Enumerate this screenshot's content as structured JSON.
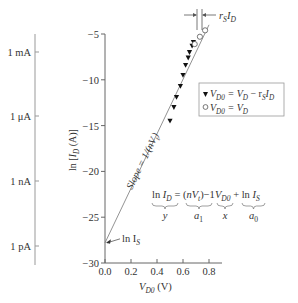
{
  "chart_data": {
    "type": "scatter",
    "title": "",
    "xlabel": "V_D0 (V)",
    "ylabel": "ln [I_D (A)]",
    "xlim": [
      0.0,
      0.9
    ],
    "ylim": [
      -30,
      -5
    ],
    "x_ticks": [
      "0.0",
      "0.2",
      "0.4",
      "0.6",
      "0.8"
    ],
    "y_ticks": [
      "−5",
      "−10",
      "−15",
      "−20",
      "−25",
      "−30"
    ],
    "secondary_y_ticks": [
      "1 mA",
      "1 μA",
      "1 nA",
      "1 pA"
    ],
    "grid": false,
    "series": [
      {
        "name": "V_D0 = V_D − r_S I_D",
        "marker": "filled-triangle-down",
        "x": [
          0.5,
          0.53,
          0.55,
          0.58,
          0.6,
          0.62,
          0.64,
          0.65,
          0.67,
          0.68
        ],
        "y": [
          -14.5,
          -13.0,
          -11.9,
          -10.7,
          -9.5,
          -8.4,
          -7.6,
          -7.0,
          -6.3,
          -5.9
        ]
      },
      {
        "name": "V_D0 = V_D",
        "marker": "open-circle",
        "x": [
          0.69,
          0.73,
          0.77
        ],
        "y": [
          -6.1,
          -5.3,
          -4.6
        ]
      },
      {
        "name": "fit line",
        "type": "line",
        "x": [
          0.0,
          0.8
        ],
        "y": [
          -27.8,
          -4.0
        ]
      }
    ],
    "annotations": [
      "Slope = 1/(nV_t)",
      "ln I_S",
      "r_S I_D",
      "ln I_D = (nV_t)^−1 V_D0 + ln I_S",
      "y",
      "a1",
      "x",
      "a0"
    ],
    "legend_position": "right, upper-middle"
  },
  "labels": {
    "ylabel": "ln [I_D (A)]",
    "xlabel_main": "V",
    "xlabel_sub": "D0",
    "xlabel_unit": " (V)",
    "slope": "Slope = 1/(nV",
    "slope_sub": "t",
    "slope_end": ")",
    "ln_is": "ln I",
    "ln_is_sub": "S",
    "rs_id": "r",
    "rs_sub": "S",
    "rs_id2": "I",
    "rs_id2_sub": "D",
    "legend1": "V",
    "legend1_sub": "D0",
    "legend1_rest": " = V",
    "legend1_sub2": "D",
    "legend1_rest2": " − r",
    "legend1_sub3": "S",
    "legend1_rest3": "I",
    "legend1_sub4": "D",
    "legend2": "V",
    "legend2_sub": "D0",
    "legend2_rest": " = V",
    "legend2_sub2": "D",
    "eq_y": "y",
    "eq_a1": "a",
    "eq_a1_sub": "1",
    "eq_x": "x",
    "eq_a0": "a",
    "eq_a0_sub": "0"
  }
}
